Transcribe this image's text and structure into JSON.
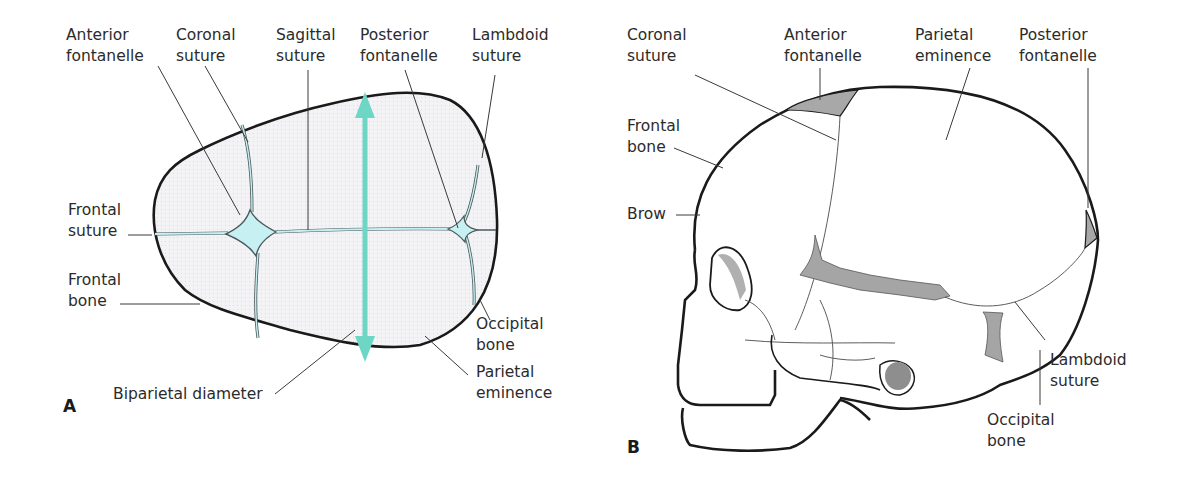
{
  "colors": {
    "teal_arrow": "#6dd6c4",
    "fontanelle_fill": "#c7f0f2",
    "bone_fill": "#f1f1f3",
    "shade_gray": "#9a9a9a",
    "outline": "#1a1a1a"
  },
  "panel_a": {
    "letter": "A",
    "labels": {
      "anterior_fontanelle": [
        "Anterior",
        "fontanelle"
      ],
      "coronal_suture": [
        "Coronal",
        "suture"
      ],
      "sagittal_suture": [
        "Sagittal",
        "suture"
      ],
      "posterior_fontanelle": [
        "Posterior",
        "fontanelle"
      ],
      "lambdoid_suture": [
        "Lambdoid",
        "suture"
      ],
      "frontal_suture": [
        "Frontal",
        "suture"
      ],
      "frontal_bone": [
        "Frontal",
        "bone"
      ],
      "occipital_bone": [
        "Occipital",
        "bone"
      ],
      "parietal_eminence": [
        "Parietal",
        "eminence"
      ],
      "biparietal_diameter": "Biparietal diameter"
    }
  },
  "panel_b": {
    "letter": "B",
    "labels": {
      "coronal_suture": [
        "Coronal",
        "suture"
      ],
      "anterior_fontanelle": [
        "Anterior",
        "fontanelle"
      ],
      "parietal_eminence": [
        "Parietal",
        "eminence"
      ],
      "posterior_fontanelle": [
        "Posterior",
        "fontanelle"
      ],
      "frontal_bone": [
        "Frontal",
        "bone"
      ],
      "brow": "Brow",
      "lambdoid_suture": [
        "Lambdoid",
        "suture"
      ],
      "occipital_bone": [
        "Occipital",
        "bone"
      ]
    }
  }
}
